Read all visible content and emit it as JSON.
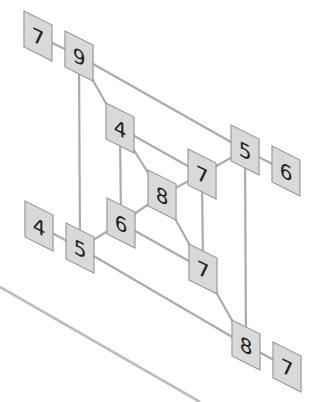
{
  "diagram": {
    "type": "skewed nested-square graph",
    "colors": {
      "node_fill": "#d9d9d9",
      "node_border": "#9a9a9a",
      "edge": "#ababab",
      "text": "#222222"
    },
    "nodes": [
      {
        "id": "ext-top-left",
        "label": "7",
        "cx": 38,
        "cy": 36
      },
      {
        "id": "outer-top-left",
        "label": "9",
        "cx": 79,
        "cy": 56
      },
      {
        "id": "inner-top-left",
        "label": "4",
        "cx": 120,
        "cy": 128
      },
      {
        "id": "center",
        "label": "8",
        "cx": 162,
        "cy": 195
      },
      {
        "id": "inner-top-right",
        "label": "7",
        "cx": 202,
        "cy": 174
      },
      {
        "id": "outer-top-right",
        "label": "5",
        "cx": 245,
        "cy": 150
      },
      {
        "id": "ext-top-right",
        "label": "6",
        "cx": 286,
        "cy": 171
      },
      {
        "id": "ext-bottom-left",
        "label": "4",
        "cx": 39,
        "cy": 226
      },
      {
        "id": "outer-bottom-left",
        "label": "5",
        "cx": 80,
        "cy": 248
      },
      {
        "id": "inner-bottom-left",
        "label": "6",
        "cx": 121,
        "cy": 223
      },
      {
        "id": "inner-bottom-right",
        "label": "7",
        "cx": 203,
        "cy": 269
      },
      {
        "id": "outer-bottom-right",
        "label": "8",
        "cx": 246,
        "cy": 345
      },
      {
        "id": "ext-bottom-right",
        "label": "7",
        "cx": 287,
        "cy": 367
      }
    ],
    "edges": [
      [
        "ext-top-left",
        "outer-top-left"
      ],
      [
        "outer-top-left",
        "outer-top-right"
      ],
      [
        "outer-top-left",
        "outer-bottom-left"
      ],
      [
        "outer-top-left",
        "inner-top-left"
      ],
      [
        "outer-top-right",
        "ext-top-right"
      ],
      [
        "outer-top-right",
        "inner-top-right"
      ],
      [
        "outer-top-right",
        "outer-bottom-right"
      ],
      [
        "ext-bottom-left",
        "outer-bottom-left"
      ],
      [
        "outer-bottom-left",
        "inner-bottom-left"
      ],
      [
        "outer-bottom-left",
        "outer-bottom-right"
      ],
      [
        "outer-bottom-right",
        "ext-bottom-right"
      ],
      [
        "outer-bottom-right",
        "inner-bottom-right"
      ],
      [
        "inner-top-left",
        "inner-top-right"
      ],
      [
        "inner-top-left",
        "inner-bottom-left"
      ],
      [
        "inner-top-left",
        "center"
      ],
      [
        "inner-top-right",
        "center"
      ],
      [
        "inner-top-right",
        "inner-bottom-right"
      ],
      [
        "inner-bottom-left",
        "center"
      ],
      [
        "inner-bottom-left",
        "inner-bottom-right"
      ],
      [
        "center",
        "inner-bottom-right"
      ]
    ],
    "decorative_lines": [
      {
        "x1": 0,
        "y1": 287,
        "x2": 200,
        "y2": 402
      }
    ]
  }
}
